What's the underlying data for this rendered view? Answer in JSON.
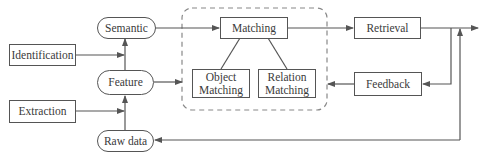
{
  "diagram": {
    "nodes": [
      {
        "id": "identification",
        "label": "Identification",
        "shape": "rect"
      },
      {
        "id": "extraction",
        "label": "Extraction",
        "shape": "rect"
      },
      {
        "id": "semantic",
        "label": "Semantic",
        "shape": "pill"
      },
      {
        "id": "feature",
        "label": "Feature",
        "shape": "pill"
      },
      {
        "id": "raw_data",
        "label": "Raw data",
        "shape": "pill"
      },
      {
        "id": "matching",
        "label": "Matching",
        "shape": "rect"
      },
      {
        "id": "object_matching",
        "label": "Object\nMatching",
        "shape": "rect"
      },
      {
        "id": "relation_matching",
        "label": "Relation\nMatching",
        "shape": "rect"
      },
      {
        "id": "retrieval",
        "label": "Retrieval",
        "shape": "rect"
      },
      {
        "id": "feedback",
        "label": "Feedback",
        "shape": "rect"
      }
    ],
    "groups": [
      {
        "id": "matching_group",
        "style": "dashed",
        "contains": [
          "matching",
          "object_matching",
          "relation_matching"
        ]
      }
    ],
    "edges": [
      {
        "from": "identification",
        "to": "semantic-feature-link",
        "arrow": true
      },
      {
        "from": "extraction",
        "to": "feature-rawdata-link",
        "arrow": true
      },
      {
        "from": "raw_data",
        "to": "feature",
        "arrow": true
      },
      {
        "from": "feature",
        "to": "semantic",
        "arrow": true
      },
      {
        "from": "semantic",
        "to": "matching",
        "arrow": true
      },
      {
        "from": "feature",
        "to": "matching_group",
        "arrow": true
      },
      {
        "from": "matching",
        "to": "object_matching",
        "arrow": false
      },
      {
        "from": "matching",
        "to": "relation_matching",
        "arrow": false
      },
      {
        "from": "matching",
        "to": "retrieval",
        "arrow": true
      },
      {
        "from": "retrieval",
        "to": "output",
        "arrow": true
      },
      {
        "from": "retrieval",
        "to": "feedback",
        "arrow": true
      },
      {
        "from": "feedback",
        "to": "matching_group",
        "arrow": true
      },
      {
        "from": "raw_data-loop",
        "to": "output",
        "arrow": true
      },
      {
        "from": "output-loop",
        "to": "raw_data",
        "arrow": true
      }
    ],
    "colors": {
      "stroke": "#555555",
      "dashed": "#888888",
      "text": "#3a3a3a"
    }
  }
}
